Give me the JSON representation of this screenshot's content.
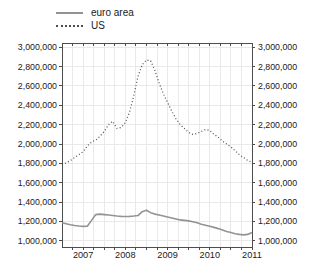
{
  "colors": {
    "background": "#ffffff",
    "grid": "#e9e9e9",
    "axis": "#4d4d4d",
    "text": "#1a1a1a",
    "euro_area_line": "#939393",
    "us_line": "#4d4d4d"
  },
  "chart_data": {
    "type": "line",
    "title": "",
    "xlabel": "",
    "ylabel": "",
    "grid": "both",
    "legend_position": "top-center",
    "xlim": [
      2006.5,
      2011.0
    ],
    "ylim": [
      1000000,
      3000000
    ],
    "x_minor_tick_step": 0.25,
    "x_tick_values": [
      2007,
      2008,
      2009,
      2010,
      2011
    ],
    "x_tick_labels": [
      "2007",
      "2008",
      "2009",
      "2010",
      "2011"
    ],
    "y_tick_values": [
      1000000,
      1200000,
      1400000,
      1600000,
      1800000,
      2000000,
      2200000,
      2400000,
      2600000,
      2800000,
      3000000
    ],
    "y_tick_labels": [
      "1,000,000",
      "1,200,000",
      "1,400,000",
      "1,600,000",
      "1,800,000",
      "2,000,000",
      "2,200,000",
      "2,400,000",
      "2,600,000",
      "2,800,000",
      "3,000,000"
    ],
    "y_labels_on_both_sides": true,
    "x": [
      2006.5,
      2006.6,
      2006.7,
      2006.8,
      2006.9,
      2007.0,
      2007.1,
      2007.2,
      2007.3,
      2007.4,
      2007.5,
      2007.6,
      2007.7,
      2007.8,
      2007.9,
      2008.0,
      2008.1,
      2008.2,
      2008.3,
      2008.4,
      2008.5,
      2008.6,
      2008.7,
      2008.8,
      2008.9,
      2009.0,
      2009.1,
      2009.2,
      2009.3,
      2009.4,
      2009.5,
      2009.6,
      2009.7,
      2009.8,
      2009.9,
      2010.0,
      2010.1,
      2010.2,
      2010.3,
      2010.4,
      2010.5,
      2010.6,
      2010.7,
      2010.8,
      2010.9,
      2011.0
    ],
    "series": [
      {
        "name": "euro area",
        "color": "#939393",
        "line_style": "solid",
        "values": [
          1185000,
          1175000,
          1165000,
          1158000,
          1152000,
          1148000,
          1150000,
          1210000,
          1270000,
          1275000,
          1270000,
          1265000,
          1260000,
          1255000,
          1252000,
          1250000,
          1252000,
          1255000,
          1260000,
          1300000,
          1315000,
          1290000,
          1275000,
          1265000,
          1255000,
          1245000,
          1235000,
          1225000,
          1215000,
          1210000,
          1205000,
          1195000,
          1185000,
          1170000,
          1160000,
          1150000,
          1138000,
          1125000,
          1110000,
          1095000,
          1085000,
          1072000,
          1065000,
          1060000,
          1065000,
          1085000
        ]
      },
      {
        "name": "US",
        "color": "#4d4d4d",
        "line_style": "dotted",
        "values": [
          1785000,
          1805000,
          1830000,
          1860000,
          1890000,
          1920000,
          1980000,
          2020000,
          2040000,
          2080000,
          2130000,
          2200000,
          2235000,
          2160000,
          2170000,
          2220000,
          2330000,
          2500000,
          2700000,
          2820000,
          2870000,
          2860000,
          2760000,
          2630000,
          2520000,
          2430000,
          2340000,
          2260000,
          2200000,
          2160000,
          2120000,
          2100000,
          2110000,
          2130000,
          2150000,
          2140000,
          2100000,
          2070000,
          2030000,
          2000000,
          1970000,
          1930000,
          1890000,
          1860000,
          1830000,
          1810000
        ]
      }
    ]
  }
}
